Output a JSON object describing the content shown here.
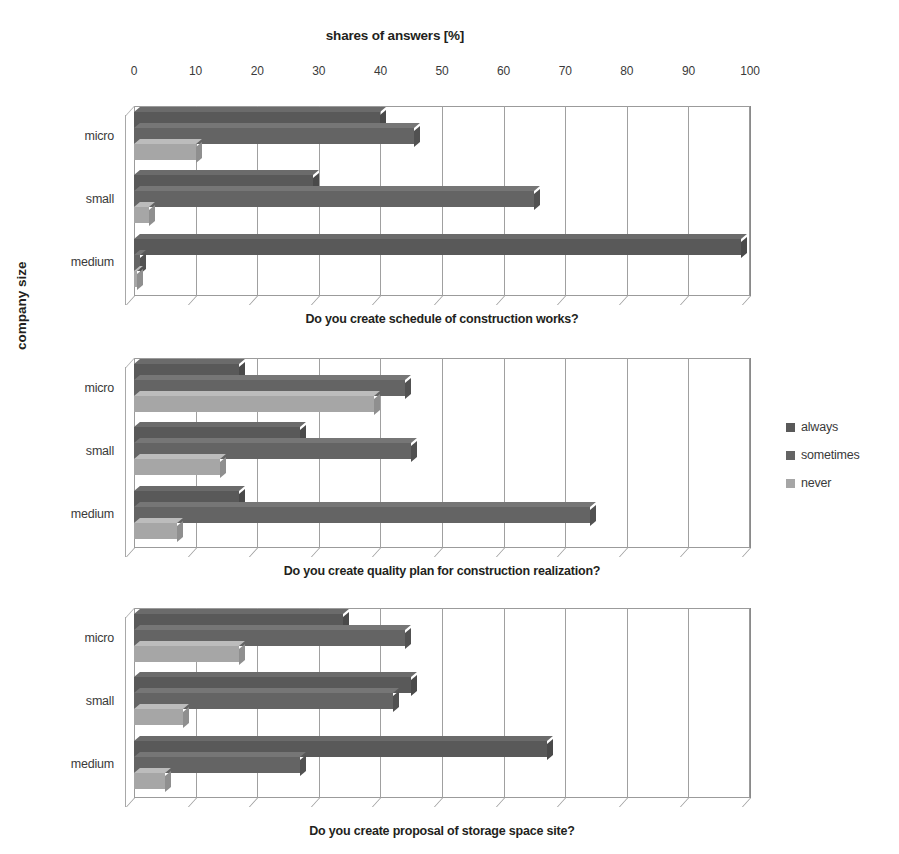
{
  "chart_title": "shares of answers [%]",
  "y_axis_label": "company size",
  "axis": {
    "ticks": [
      0,
      10,
      20,
      30,
      40,
      50,
      60,
      70,
      80,
      90,
      100
    ],
    "min": 0,
    "max": 100
  },
  "legend": {
    "position": "right",
    "items": [
      {
        "label": "always",
        "color": "#595959",
        "key": "always"
      },
      {
        "label": "sometimes",
        "color": "#646464",
        "key": "sometimes"
      },
      {
        "label": "never",
        "color": "#a6a6a6",
        "key": "never"
      }
    ]
  },
  "categories": [
    "micro",
    "small",
    "medium"
  ],
  "chart_data": {
    "type": "bar",
    "orientation": "horizontal",
    "title": "shares of answers [%]",
    "xlabel": "shares of answers [%]",
    "ylabel": "company size",
    "xlim": [
      0,
      100
    ],
    "grid": true,
    "legend_position": "right",
    "categories": [
      "micro",
      "small",
      "medium"
    ],
    "panels": [
      {
        "caption": "Do you create schedule of  construction works?",
        "series": [
          {
            "name": "always",
            "values": [
              40.0,
              29.0,
              98.5
            ]
          },
          {
            "name": "sometimes",
            "values": [
              45.5,
              65.0,
              1.0
            ]
          },
          {
            "name": "never",
            "values": [
              10.0,
              2.5,
              0.5
            ]
          }
        ]
      },
      {
        "caption": "Do you create quality plan for construction realization?",
        "series": [
          {
            "name": "always",
            "values": [
              17.0,
              27.0,
              17.0
            ]
          },
          {
            "name": "sometimes",
            "values": [
              44.0,
              45.0,
              74.0
            ]
          },
          {
            "name": "never",
            "values": [
              39.0,
              14.0,
              7.0
            ]
          }
        ]
      },
      {
        "caption": "Do you create proposal of  storage space site?",
        "series": [
          {
            "name": "always",
            "values": [
              34.0,
              45.0,
              67.0
            ]
          },
          {
            "name": "sometimes",
            "values": [
              44.0,
              42.0,
              27.0
            ]
          },
          {
            "name": "never",
            "values": [
              17.0,
              8.0,
              5.0
            ]
          }
        ]
      }
    ]
  }
}
